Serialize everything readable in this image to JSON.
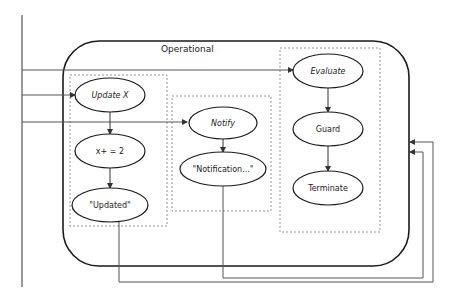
{
  "diagram": {
    "container_label": "Operational",
    "colors": {
      "container_stroke": "#1a1a1a",
      "line": "#555555",
      "dashed": "#777777",
      "node_stroke": "#1a1a1a",
      "text": "#222222"
    },
    "groups": [
      {
        "id": "update-group",
        "nodes": [
          "Update X",
          "x+ = 2",
          "\"Updated\""
        ]
      },
      {
        "id": "notify-group",
        "nodes": [
          "Notify",
          "\"Notification...\""
        ]
      },
      {
        "id": "evaluate-group",
        "nodes": [
          "Evaluate",
          "Guard",
          "Terminate"
        ]
      }
    ],
    "nodes": {
      "update_x": "Update X",
      "x_plus": "x+ = 2",
      "updated": "\"Updated\"",
      "notify": "Notify",
      "notification": "\"Notification...\"",
      "evaluate": "Evaluate",
      "guard": "Guard",
      "terminate": "Terminate"
    },
    "edges": [
      {
        "from": "input-bus",
        "to": "Evaluate"
      },
      {
        "from": "input-bus",
        "to": "Update X"
      },
      {
        "from": "input-bus",
        "to": "Notify"
      },
      {
        "from": "Update X",
        "to": "x+ = 2"
      },
      {
        "from": "x+ = 2",
        "to": "\"Updated\""
      },
      {
        "from": "Notify",
        "to": "\"Notification...\""
      },
      {
        "from": "Evaluate",
        "to": "Guard"
      },
      {
        "from": "Guard",
        "to": "Terminate"
      },
      {
        "from": "\"Updated\"",
        "to": "Operational (feedback)"
      },
      {
        "from": "\"Notification...\"",
        "to": "Operational (feedback)"
      }
    ]
  }
}
